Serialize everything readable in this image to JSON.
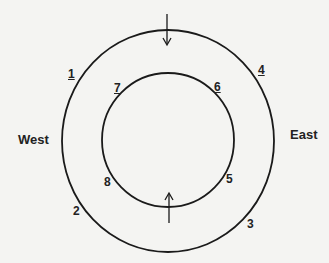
{
  "diagram": {
    "directions": {
      "west": "West",
      "east": "East"
    },
    "outer_labels": [
      {
        "id": "1",
        "text": "1",
        "underlined": true
      },
      {
        "id": "2",
        "text": "2",
        "underlined": false
      },
      {
        "id": "3",
        "text": "3",
        "underlined": false
      },
      {
        "id": "4",
        "text": "4",
        "underlined": true
      }
    ],
    "inner_labels": [
      {
        "id": "5",
        "text": "5",
        "underlined": false
      },
      {
        "id": "6",
        "text": "6",
        "underlined": true
      },
      {
        "id": "7",
        "text": "7",
        "underlined": true
      },
      {
        "id": "8",
        "text": "8",
        "underlined": false
      }
    ],
    "arrows": [
      {
        "position": "top",
        "direction": "down"
      },
      {
        "position": "bottom-inner",
        "direction": "up"
      }
    ],
    "colors": {
      "background": "#f4f4f2",
      "stroke": "#1a1a1a"
    }
  }
}
